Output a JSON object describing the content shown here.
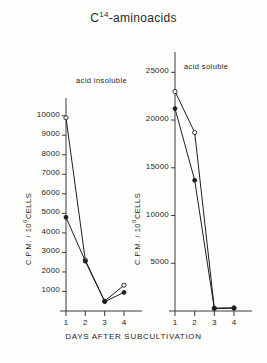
{
  "title": {
    "prefix": "C",
    "superscript": "14",
    "suffix": "-aminoacids"
  },
  "xaxis_title": "DAYS  AFTER  SUBCULTIVATION",
  "yaxis_title_prefix": "C.P.M. / 10",
  "yaxis_title_sup": "6",
  "yaxis_title_suffix": "CELLS",
  "panels": [
    {
      "tag": "acid  insoluble",
      "yticks": [
        "10000",
        "9000",
        "8000",
        "7000",
        "6000",
        "5000",
        "4000",
        "3000",
        "2000",
        "1000"
      ],
      "ytick_values": [
        10000,
        9000,
        8000,
        7000,
        6000,
        5000,
        4000,
        3000,
        2000,
        1000
      ],
      "xticks": [
        "1",
        "2",
        "3",
        "4"
      ]
    },
    {
      "tag": "acid  soluble",
      "yticks": [
        "25000",
        "20000",
        "15000",
        "10000",
        "5000"
      ],
      "ytick_values": [
        25000,
        20000,
        15000,
        10000,
        5000
      ],
      "xticks": [
        "1",
        "2",
        "3",
        "4"
      ]
    }
  ],
  "chart_data": [
    {
      "type": "line",
      "title": "acid insoluble",
      "xlabel": "DAYS AFTER SUBCULTIVATION",
      "ylabel": "C.P.M. / 10^6 CELLS",
      "x": [
        1,
        2,
        3,
        4
      ],
      "xlim": [
        0.6,
        4.5
      ],
      "ylim": [
        0,
        10600
      ],
      "grid": false,
      "legend": "none",
      "series": [
        {
          "name": "open-circle",
          "marker": "open-circle",
          "values": [
            9900,
            2600,
            500,
            1320
          ]
        },
        {
          "name": "filled-circle",
          "marker": "filled-circle",
          "values": [
            4800,
            2550,
            480,
            950
          ]
        }
      ]
    },
    {
      "type": "line",
      "title": "acid soluble",
      "xlabel": "DAYS AFTER SUBCULTIVATION",
      "ylabel": "C.P.M. / 10^6 CELLS",
      "x": [
        1,
        2,
        3,
        4
      ],
      "xlim": [
        0.6,
        4.5
      ],
      "ylim": [
        0,
        26500
      ],
      "grid": false,
      "legend": "none",
      "series": [
        {
          "name": "open-circle",
          "marker": "open-circle",
          "values": [
            23000,
            18700,
            300,
            330
          ]
        },
        {
          "name": "filled-circle",
          "marker": "filled-circle",
          "values": [
            21200,
            13700,
            250,
            280
          ]
        }
      ]
    }
  ]
}
